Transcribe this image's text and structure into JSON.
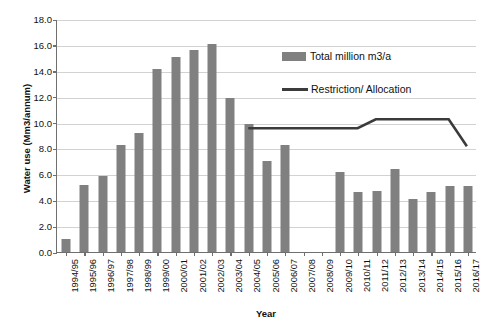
{
  "chart_data": {
    "type": "bar",
    "title": "",
    "xlabel": "Year",
    "ylabel": "Water use (Mm3/annum)",
    "ylim": [
      0,
      18
    ],
    "ytick_step": 2,
    "ytick_labels": [
      "0.0",
      "2.0",
      "4.0",
      "6.0",
      "8.0",
      "10.0",
      "12.0",
      "14.0",
      "16.0",
      "18.0"
    ],
    "grid": true,
    "legend_position": "inside-top-right",
    "categories": [
      "1994/95",
      "1995/96",
      "1996/97",
      "1997/98",
      "1998/99",
      "1999/00",
      "2000/01",
      "2001/02",
      "2002/03",
      "2003/04",
      "2004/05",
      "2005/06",
      "2006/07",
      "2007/08",
      "2008/09",
      "2009/10",
      "2010/11",
      "2011/12",
      "2012/13",
      "2013/14",
      "2014/15",
      "2015/16",
      "2016/17"
    ],
    "series": [
      {
        "name": "Total million m3/a",
        "type": "bar",
        "color": "#808080",
        "values": [
          1.0,
          5.2,
          5.9,
          8.3,
          9.2,
          14.1,
          15.1,
          15.6,
          16.1,
          11.9,
          9.9,
          7.05,
          8.3,
          null,
          null,
          6.2,
          4.65,
          4.75,
          6.4,
          4.1,
          4.6,
          5.1,
          5.1
        ]
      },
      {
        "name": "Restriction/ Allocation",
        "type": "line",
        "color": "#3b3b3b",
        "values": [
          null,
          null,
          null,
          null,
          null,
          null,
          null,
          null,
          null,
          null,
          9.6,
          9.6,
          9.6,
          9.6,
          9.6,
          9.6,
          9.6,
          10.3,
          10.3,
          10.3,
          10.3,
          10.3,
          8.2
        ]
      }
    ]
  },
  "legend": {
    "items": [
      {
        "label": "Total million m3/a",
        "marker": "bar-swatch"
      },
      {
        "label": "Restriction/ Allocation",
        "marker": "line-swatch"
      }
    ]
  }
}
